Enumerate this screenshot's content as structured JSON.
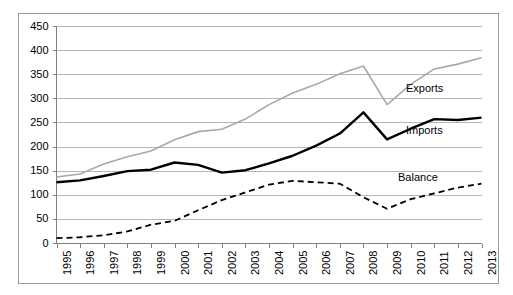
{
  "chart_data": {
    "type": "line",
    "title": "",
    "subtitle": "",
    "xlabel": "",
    "ylabel": "",
    "xlim": [
      1995,
      2013
    ],
    "ylim": [
      0,
      450
    ],
    "yticks": [
      0,
      50,
      100,
      150,
      200,
      250,
      300,
      350,
      400,
      450
    ],
    "grid": true,
    "legend_position": "inline-right",
    "categories": [
      1995,
      1996,
      1997,
      1998,
      1999,
      2000,
      2001,
      2002,
      2003,
      2004,
      2005,
      2006,
      2007,
      2008,
      2009,
      2010,
      2011,
      2012,
      2013
    ],
    "x_tick_labels": [
      "1995",
      "1996",
      "1997",
      "1998",
      "1999",
      "2000",
      "2001",
      "2002",
      "2003",
      "2004",
      "2005",
      "2006",
      "2007",
      "2008",
      "2009",
      "2010",
      "2011",
      "2012",
      "2013"
    ],
    "y_tick_labels": [
      "0",
      "50",
      "100",
      "150",
      "200",
      "250",
      "300",
      "350",
      "400",
      "450"
    ],
    "series": [
      {
        "name": "Exports",
        "label": "Exports",
        "color": "#a8a8a8",
        "style": "solid",
        "width": 1.6,
        "values": [
          138,
          144,
          165,
          180,
          192,
          215,
          232,
          237,
          258,
          288,
          312,
          330,
          352,
          368,
          288,
          330,
          362,
          372,
          385
        ]
      },
      {
        "name": "Imports",
        "label": "Imports",
        "color": "#000000",
        "style": "solid",
        "width": 2.4,
        "values": [
          127,
          131,
          140,
          150,
          153,
          168,
          163,
          147,
          152,
          166,
          182,
          203,
          228,
          272,
          216,
          238,
          258,
          256,
          261
        ]
      },
      {
        "name": "Balance",
        "label": "Balance",
        "color": "#000000",
        "style": "dashed",
        "width": 1.8,
        "values": [
          11,
          13,
          17,
          25,
          39,
          47,
          69,
          90,
          106,
          122,
          130,
          127,
          124,
          96,
          72,
          92,
          104,
          116,
          124
        ]
      }
    ],
    "annotations": [
      {
        "text": "Exports",
        "series": "Exports"
      },
      {
        "text": "Imports",
        "series": "Imports"
      },
      {
        "text": "Balance",
        "series": "Balance"
      }
    ]
  },
  "axes": {
    "frame_color": "#9a9a9a",
    "gridline_color": "#b6b6b6",
    "axis_color": "#808080",
    "background": "#ffffff"
  },
  "labels": {
    "exports": "Exports",
    "imports": "Imports",
    "balance": "Balance"
  }
}
